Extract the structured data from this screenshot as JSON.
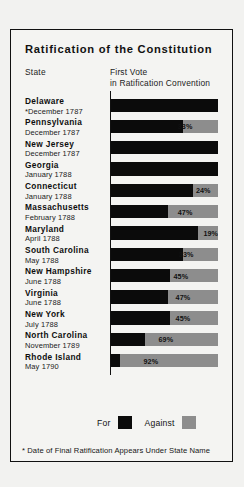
{
  "chart_title": "Ratification of the Constitution",
  "headers": {
    "state": "State",
    "vote_line1": "First Vote",
    "vote_line2": "in Ratification Convention"
  },
  "legend": {
    "for_label": "For",
    "against_label": "Against",
    "for_color": "#0b0b0b",
    "against_color": "#8d8d8d"
  },
  "footnote": "* Date of Final Ratification Appears Under State Name",
  "chart_data": {
    "type": "bar",
    "title": "Ratification of the Constitution",
    "xlabel": "First Vote in Ratification Convention",
    "ylabel": "State",
    "orientation": "horizontal",
    "stacked": true,
    "xlim": [
      0,
      100
    ],
    "grid": false,
    "legend_position": "bottom-right",
    "categories": [
      "Delaware",
      "Pennsylvania",
      "New Jersey",
      "Georgia",
      "Connecticut",
      "Massachusetts",
      "Maryland",
      "South Carolina",
      "New Hampshire",
      "Virginia",
      "New York",
      "North Carolina",
      "Rhode Island"
    ],
    "series": [
      {
        "name": "For",
        "values": [
          100,
          67,
          100,
          100,
          76,
          53,
          81,
          67,
          55,
          53,
          55,
          31,
          8
        ]
      },
      {
        "name": "Against",
        "values": [
          0,
          33,
          0,
          0,
          24,
          47,
          19,
          33,
          45,
          47,
          45,
          69,
          92
        ]
      }
    ]
  },
  "rows": [
    {
      "state": "Delaware",
      "date": "*December 1787",
      "against": 0,
      "label": "",
      "label_x": 0
    },
    {
      "state": "Pennsylvania",
      "date": "December 1787",
      "against": 33,
      "label": "33%",
      "label_x": 62
    },
    {
      "state": "New Jersey",
      "date": "December 1787",
      "against": 0,
      "label": "",
      "label_x": 0
    },
    {
      "state": "Georgia",
      "date": "January 1788",
      "against": 0,
      "label": "",
      "label_x": 0
    },
    {
      "state": "Connecticut",
      "date": "January 1788",
      "against": 24,
      "label": "24%",
      "label_x": 79
    },
    {
      "state": "Massachusetts",
      "date": "February 1788",
      "against": 47,
      "label": "47%",
      "label_x": 62
    },
    {
      "state": "Maryland",
      "date": "April 1788",
      "against": 19,
      "label": "19%",
      "label_x": 86
    },
    {
      "state": "South Carolina",
      "date": "May 1788",
      "against": 33,
      "label": "33%",
      "label_x": 63
    },
    {
      "state": "New Hampshire",
      "date": "June 1788",
      "against": 45,
      "label": "45%",
      "label_x": 58
    },
    {
      "state": "Virginia",
      "date": "June 1788",
      "against": 47,
      "label": "47%",
      "label_x": 60
    },
    {
      "state": "New York",
      "date": "July 1788",
      "against": 45,
      "label": "45%",
      "label_x": 60
    },
    {
      "state": "North Carolina",
      "date": "November 1789",
      "against": 69,
      "label": "69%",
      "label_x": 44
    },
    {
      "state": "Rhode Island",
      "date": "May 1790",
      "against": 92,
      "label": "92%",
      "label_x": 30
    }
  ]
}
